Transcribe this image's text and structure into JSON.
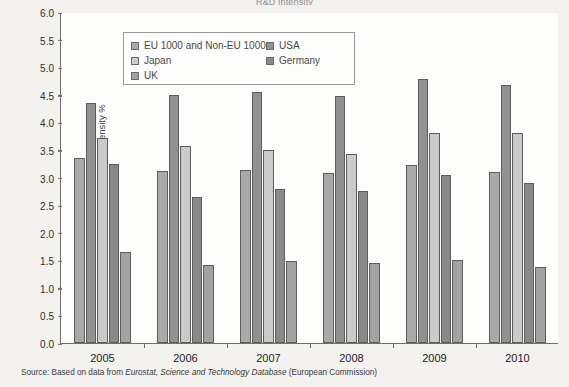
{
  "chart_data": {
    "type": "bar",
    "title": "R&D intensity",
    "xlabel": "",
    "ylabel": "R&D intensity %",
    "ylim": [
      0.0,
      6.0
    ],
    "ytick_step": 0.5,
    "ytick_labels": [
      "6.0",
      "5.5",
      "5.0",
      "4.5",
      "4.0",
      "3.5",
      "3.0",
      "2.5",
      "2.0",
      "1.5",
      "1.0",
      "0.5",
      "0.0"
    ],
    "grid": false,
    "legend_position": "top-left inside",
    "categories": [
      "2005",
      "2006",
      "2007",
      "2008",
      "2009",
      "2010"
    ],
    "series": [
      {
        "name": "EU 1000 and Non-EU 1000",
        "color": "#a9a9a9",
        "values": [
          3.35,
          3.12,
          3.14,
          3.08,
          3.23,
          3.1
        ]
      },
      {
        "name": "USA",
        "color": "#919191",
        "values": [
          4.35,
          4.5,
          4.55,
          4.47,
          4.78,
          4.68
        ]
      },
      {
        "name": "Japan",
        "color": "#cacaca",
        "values": [
          3.72,
          3.58,
          3.5,
          3.42,
          3.8,
          3.8
        ]
      },
      {
        "name": "Germany",
        "color": "#898989",
        "values": [
          3.25,
          2.65,
          2.8,
          2.75,
          3.05,
          2.9
        ]
      },
      {
        "name": "UK",
        "color": "#a2a2a2",
        "values": [
          1.65,
          1.42,
          1.48,
          1.45,
          1.5,
          1.37
        ]
      }
    ]
  },
  "legend": {
    "left_column": [
      {
        "label": "EU 1000 and Non-EU 1000",
        "color": "#a9a9a9"
      },
      {
        "label": "Japan",
        "color": "#cacaca"
      },
      {
        "label": "UK",
        "color": "#a2a2a2"
      }
    ],
    "right_column": [
      {
        "label": "USA",
        "color": "#919191"
      },
      {
        "label": "Germany",
        "color": "#898989"
      }
    ]
  },
  "source": {
    "prefix": "Source: Based on data from ",
    "italic_one": "Eurostat, Science and Technology Database",
    "suffix": " (European Commission)"
  }
}
